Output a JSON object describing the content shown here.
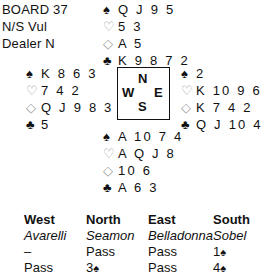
{
  "board": {
    "number_label": "BOARD 37",
    "vulnerability": "N/S Vul",
    "dealer": "Dealer N"
  },
  "suit_symbols": {
    "spades": "♠",
    "hearts": "♡",
    "diamonds": "◇",
    "clubs": "♣"
  },
  "colors": {
    "black_suit": "#111111",
    "red_suit_outline": "#9a9a9a"
  },
  "hands": {
    "north": {
      "spades": "Q J 9 5",
      "hearts": "5 3",
      "diamonds": "A 5",
      "clubs": "K 9 8 7 2"
    },
    "west": {
      "spades": "K 8 6 3",
      "hearts": "7 4 2",
      "diamonds": "Q J 9 8 3",
      "clubs": "5"
    },
    "east": {
      "spades": "2",
      "hearts": "K 10 9 6",
      "diamonds": "K 7 4 2",
      "clubs": "Q J 10 4"
    },
    "south": {
      "spades": "A 10 7 4",
      "hearts": "A Q J 8",
      "diamonds": "10 6",
      "clubs": "A 6 3"
    }
  },
  "compass": {
    "n": "N",
    "s": "S",
    "e": "E",
    "w": "W"
  },
  "auction": {
    "headers": [
      "West",
      "North",
      "East",
      "South"
    ],
    "players": [
      "Avarelli",
      "Seamon",
      "Belladonna",
      "Sobel"
    ],
    "rounds": [
      [
        {
          "text": "–"
        },
        {
          "text": "Pass"
        },
        {
          "text": "Pass"
        },
        {
          "level": "1",
          "suit": "♠"
        }
      ],
      [
        {
          "text": "Pass"
        },
        {
          "level": "3",
          "suit": "♠"
        },
        {
          "text": "Pass"
        },
        {
          "level": "4",
          "suit": "♠"
        }
      ]
    ]
  }
}
